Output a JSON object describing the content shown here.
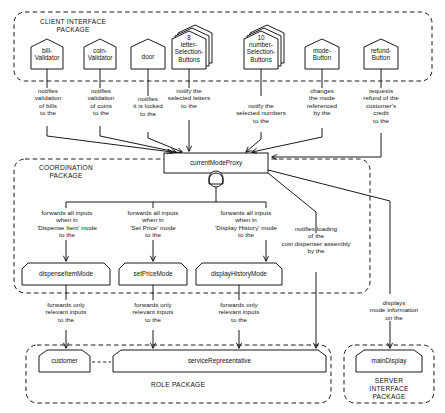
{
  "diagram": {
    "type": "uml-collaboration-diagram",
    "stroke_color": "#000000",
    "fill_color": "#ffffff",
    "packages": [
      {
        "id": "client-interface",
        "label": "CLIENT INTERFACE\nPACKAGE"
      },
      {
        "id": "coordination",
        "label": "COORDINATION\nPACKAGE"
      },
      {
        "id": "role",
        "label": "ROLE PACKAGE"
      },
      {
        "id": "server-interface",
        "label": "SERVER\nINTERFACE\nPACKAGE"
      }
    ],
    "nodes": [
      {
        "id": "bill-validator",
        "label": "bill-\nValidator",
        "shape": "pentagon",
        "package": "client-interface"
      },
      {
        "id": "coin-validator",
        "label": "coin-\nValidator",
        "shape": "pentagon",
        "package": "client-interface"
      },
      {
        "id": "door",
        "label": "door",
        "shape": "pentagon",
        "package": "client-interface"
      },
      {
        "id": "letter-selection-buttons",
        "label": "8\nletter-\nSelection-\nButtons",
        "shape": "pentagon-stacked",
        "package": "client-interface"
      },
      {
        "id": "number-selection-buttons",
        "label": "10\nnumber-\nSelection-\nButtons",
        "shape": "pentagon-stacked",
        "package": "client-interface"
      },
      {
        "id": "mode-button",
        "label": "mode-\nButton",
        "shape": "pentagon",
        "package": "client-interface"
      },
      {
        "id": "refund-button",
        "label": "refund-\nButton",
        "shape": "pentagon",
        "package": "client-interface"
      },
      {
        "id": "current-mode-proxy",
        "label": "currentModeProxy",
        "shape": "rectangle",
        "package": "coordination"
      },
      {
        "id": "dispense-item-mode",
        "label": "dispenseItemMode",
        "shape": "pentagon",
        "package": "coordination"
      },
      {
        "id": "set-price-mode",
        "label": "setPriceMode",
        "shape": "pentagon",
        "package": "coordination"
      },
      {
        "id": "display-history-mode",
        "label": "displayHistoryMode",
        "shape": "pentagon",
        "package": "coordination"
      },
      {
        "id": "customer",
        "label": "customer",
        "shape": "pentagon",
        "package": "role"
      },
      {
        "id": "service-representative",
        "label": "serviceRepresentative",
        "shape": "pentagon-wide",
        "package": "role"
      },
      {
        "id": "main-display",
        "label": "mainDisplay",
        "shape": "pentagon",
        "package": "server-interface"
      }
    ],
    "connection_labels": [
      {
        "id": "bill-to-proxy",
        "text": "notifies\nvalidation\nof bills\nto the"
      },
      {
        "id": "coin-to-proxy",
        "text": "notifies\nvalidation\nof coins\nto the"
      },
      {
        "id": "door-to-proxy",
        "text": "notifies\nit is locked\nto the"
      },
      {
        "id": "letters-to-proxy",
        "text": "notify the\nselected letters\nto the"
      },
      {
        "id": "numbers-to-proxy",
        "text": "notify the\nselected numbers\nto the"
      },
      {
        "id": "mode-to-proxy",
        "text": "changes\nthe mode\nreferenced\nby the"
      },
      {
        "id": "refund-to-proxy",
        "text": "requests\nrefund of the\ncustomer's\ncredit\nto the"
      },
      {
        "id": "proxy-to-dispense",
        "text": "forwards all inputs\nwhen in\n'Dispense Item' mode\nto the"
      },
      {
        "id": "proxy-to-setprice",
        "text": "forwards all inputs\nwhen in\n'Set Price' mode\nto the"
      },
      {
        "id": "proxy-to-history",
        "text": "forwards all inputs\nwhen in\n'Display History' mode\nto the"
      },
      {
        "id": "proxy-to-servicerep",
        "text": "notifies loading\nof the\ncoin dispenser assembly\nby the"
      },
      {
        "id": "proxy-to-maindisplay",
        "text": "displays\nmode information\non the"
      },
      {
        "id": "dispense-to-customer",
        "text": "forwards only\nrelevant inputs\nto the"
      },
      {
        "id": "setprice-to-rep",
        "text": "forwards only\nrelevant inputs\nto the"
      },
      {
        "id": "history-to-rep",
        "text": "forwards only\nrelevant inputs\nto the"
      }
    ]
  }
}
